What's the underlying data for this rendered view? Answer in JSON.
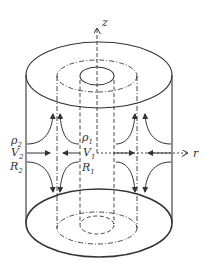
{
  "figure": {
    "type": "coaxial cylinder flow diagram",
    "axes": {
      "vertical": "z",
      "horizontal": "r"
    },
    "outer_region": {
      "density": "ρ",
      "density_sub": "2",
      "velocity": "V",
      "velocity_sub": "2",
      "radius": "R",
      "radius_sub": "2"
    },
    "inner_region": {
      "density": "ρ",
      "density_sub": "1",
      "velocity": "V",
      "velocity_sub": "1",
      "radius": "R",
      "radius_sub": "1"
    },
    "colors": {
      "stroke": "#333333",
      "background": "#ffffff"
    }
  }
}
